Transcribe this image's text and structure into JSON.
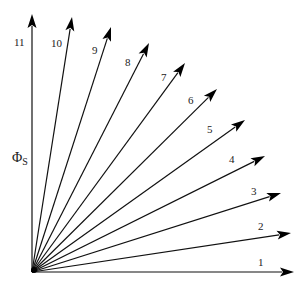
{
  "diagram": {
    "type": "vector-fan",
    "axis_label": {
      "symbol": "Φ",
      "subscript": "S"
    },
    "colors": {
      "stroke": "#111111",
      "background": "#ffffff"
    },
    "origin": [
      32,
      272
    ],
    "vectors": [
      {
        "label": "1",
        "tip": [
          294,
          272
        ],
        "label_pos": [
          258,
          266
        ]
      },
      {
        "label": "2",
        "tip": [
          291,
          233
        ],
        "label_pos": [
          258,
          230
        ]
      },
      {
        "label": "3",
        "tip": [
          281,
          193
        ],
        "label_pos": [
          251,
          195
        ]
      },
      {
        "label": "4",
        "tip": [
          265,
          156
        ],
        "label_pos": [
          229,
          163
        ]
      },
      {
        "label": "5",
        "tip": [
          245,
          120
        ],
        "label_pos": [
          207,
          133
        ]
      },
      {
        "label": "6",
        "tip": [
          217,
          89
        ],
        "label_pos": [
          188,
          104
        ]
      },
      {
        "label": "7",
        "tip": [
          185,
          63
        ],
        "label_pos": [
          161,
          81
        ]
      },
      {
        "label": "8",
        "tip": [
          149,
          43
        ],
        "label_pos": [
          125,
          66
        ]
      },
      {
        "label": "9",
        "tip": [
          111,
          27
        ],
        "label_pos": [
          92,
          54
        ]
      },
      {
        "label": "10",
        "tip": [
          72,
          17
        ],
        "label_pos": [
          51,
          47
        ]
      },
      {
        "label": "11",
        "tip": [
          32,
          14
        ],
        "label_pos": [
          14,
          46
        ]
      }
    ]
  }
}
